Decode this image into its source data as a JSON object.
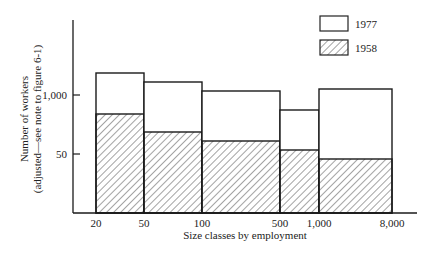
{
  "chart_data": {
    "type": "bar",
    "subtype": "variable-width overlapping histogram",
    "title": "",
    "xlabel": "Size classes by employment",
    "ylabel": "Number of workers",
    "ylabel_note": "(adjusted—see note to figure 6-1)",
    "x_tick_labels": [
      "20",
      "50",
      "100",
      "500",
      "1,000",
      "8,000"
    ],
    "y_tick_labels": [
      "50",
      "1,000"
    ],
    "categories": [
      "20–50",
      "50–100",
      "100–500",
      "500–1,000",
      "1,000–8,000"
    ],
    "series": [
      {
        "name": "1977",
        "fill": "white",
        "relative_height": [
          1.0,
          0.94,
          0.88,
          0.76,
          0.89
        ]
      },
      {
        "name": "1958",
        "fill": "diagonal-hatch",
        "relative_height": [
          0.71,
          0.58,
          0.52,
          0.45,
          0.39
        ]
      }
    ],
    "legend": {
      "position": "top-right",
      "entries": [
        "1977",
        "1958"
      ]
    },
    "grid": false,
    "geometry": {
      "axis": {
        "x0": 73,
        "y0": 213,
        "xTop": 20,
        "xEnd": 417
      },
      "y_ticks": [
        {
          "label": "1,000",
          "y": 95
        },
        {
          "label": "50",
          "y": 154
        }
      ],
      "x_ticks": [
        {
          "label": "20",
          "x": 96
        },
        {
          "label": "50",
          "x": 144
        },
        {
          "label": "100",
          "x": 202
        },
        {
          "label": "500",
          "x": 280
        },
        {
          "label": "1,000",
          "x": 319
        },
        {
          "label": "8,000",
          "x": 392
        }
      ],
      "bars": [
        {
          "x1": 96,
          "x2": 144,
          "top1977": 73,
          "top1958": 114
        },
        {
          "x1": 144,
          "x2": 202,
          "top1977": 82,
          "top1958": 132
        },
        {
          "x1": 202,
          "x2": 280,
          "top1977": 91,
          "top1958": 141
        },
        {
          "x1": 280,
          "x2": 319,
          "top1977": 110,
          "top1958": 150
        },
        {
          "x1": 319,
          "x2": 392,
          "top1977": 89,
          "top1958": 159
        }
      ]
    }
  }
}
